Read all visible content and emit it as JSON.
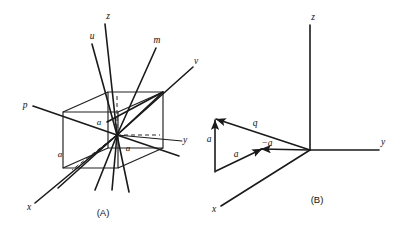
{
  "figure": {
    "background_color": "#ffffff",
    "line_color": "#1a1a1a",
    "width": 402,
    "height": 230
  },
  "panel_a": {
    "caption": "(A)",
    "caption_pos": {
      "x": 103,
      "y": 216
    },
    "description": "Oblique cube with multiple axes radiating through its center",
    "axis_labels": [
      {
        "name": "z",
        "text": "z",
        "x": 108,
        "y": 19
      },
      {
        "name": "u",
        "text": "u",
        "x": 92,
        "y": 39
      },
      {
        "name": "m",
        "text": "m",
        "x": 157,
        "y": 43
      },
      {
        "name": "v",
        "text": "v",
        "x": 196,
        "y": 64
      },
      {
        "name": "p",
        "text": "p",
        "x": 25,
        "y": 108
      },
      {
        "name": "y",
        "text": "y",
        "x": 185,
        "y": 143
      },
      {
        "name": "x",
        "text": "x",
        "x": 29,
        "y": 210
      }
    ],
    "edge_labels": [
      {
        "name": "a-top",
        "text": "a",
        "x": 99,
        "y": 125
      },
      {
        "name": "a-right",
        "text": "a",
        "x": 128,
        "y": 151
      },
      {
        "name": "a-left",
        "text": "a",
        "x": 60,
        "y": 157
      }
    ]
  },
  "panel_b": {
    "caption": "(B)",
    "caption_pos": {
      "x": 317,
      "y": 203
    },
    "description": "Right-handed axis triad with closed vector triangle a + q = a",
    "axis_labels": [
      {
        "name": "z",
        "text": "z",
        "x": 313,
        "y": 20
      },
      {
        "name": "y",
        "text": "y",
        "x": 383,
        "y": 145
      },
      {
        "name": "x",
        "text": "x",
        "x": 214,
        "y": 212
      }
    ],
    "vector_labels": [
      {
        "name": "a-vertical",
        "text": "a",
        "x": 209,
        "y": 142
      },
      {
        "name": "q-vector",
        "text": "q",
        "x": 255,
        "y": 126
      },
      {
        "name": "minus-a",
        "text": "−a",
        "x": 267,
        "y": 146
      },
      {
        "name": "a-lower",
        "text": "a",
        "x": 236,
        "y": 157
      }
    ]
  }
}
